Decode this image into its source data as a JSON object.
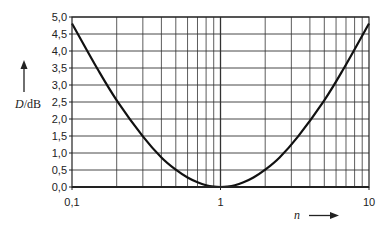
{
  "chart_data": {
    "type": "line",
    "title": "",
    "xlabel": "n",
    "ylabel": "D/dB",
    "xscale": "log",
    "xlim": [
      0.1,
      10
    ],
    "ylim": [
      0.0,
      5.0
    ],
    "grid": true,
    "legend": null,
    "x_tick_labels": [
      "0,1",
      "1",
      "10"
    ],
    "y_tick_labels": [
      "0,0",
      "0,5",
      "1,0",
      "1,5",
      "2,0",
      "2,5",
      "3,0",
      "3,5",
      "4,0",
      "4,5",
      "5,0"
    ],
    "y_ticks": [
      0.0,
      0.5,
      1.0,
      1.5,
      2.0,
      2.5,
      3.0,
      3.5,
      4.0,
      4.5,
      5.0
    ],
    "x_minor_gridlines": [
      0.2,
      0.3,
      0.4,
      0.5,
      0.6,
      0.7,
      0.8,
      0.9,
      1,
      2,
      3,
      4,
      5,
      6,
      7,
      8,
      9
    ],
    "series": [
      {
        "name": "D(n)",
        "color": "#111111",
        "x": [
          0.1,
          0.15,
          0.2,
          0.3,
          0.4,
          0.5,
          0.6,
          0.7,
          0.8,
          0.9,
          1.0,
          1.111,
          1.25,
          1.429,
          1.667,
          2.0,
          2.5,
          3.333,
          5.0,
          6.667,
          10.0
        ],
        "values": [
          4.81,
          3.44,
          2.55,
          1.49,
          0.87,
          0.51,
          0.28,
          0.14,
          0.05,
          0.01,
          0.0,
          0.01,
          0.05,
          0.14,
          0.28,
          0.51,
          0.87,
          1.49,
          2.55,
          3.44,
          4.81
        ]
      }
    ]
  },
  "axes": {
    "y_label_italic": "D",
    "y_label_unit": "/dB",
    "x_label": "n"
  }
}
